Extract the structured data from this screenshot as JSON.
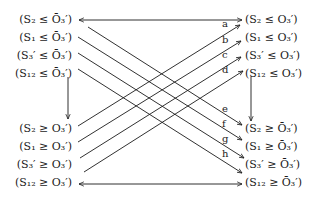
{
  "diagram": {
    "left_top": [
      "(S₂ ≤ Ō₃′)",
      "(S₁ ≤ Ō₃′)",
      "(S₃′ ≤ Ō₃′)",
      "(S₁₂ ≤ Ō₃′)"
    ],
    "left_bottom": [
      "(S₂ ≥ O₃′)",
      "(S₁ ≥ O₃′)",
      "(S₃′ ≥ O₃′)",
      "(S₁₂ ≥ O₃′)"
    ],
    "right_top": [
      "(S₂ ≤ O₃′)",
      "(S₁ ≤ O₃′)",
      "(S₃′ ≤ O₃′)",
      "(S₁₂ ≤ O₃′)"
    ],
    "right_bottom": [
      "(S₂ ≥ Ō₃′)",
      "(S₁ ≥ Ō₃′)",
      "(S₃′ ≥ Ō₃′)",
      "(S₁₂ ≥ Ō₃′)"
    ],
    "edge_labels": [
      "a",
      "b",
      "c",
      "d",
      "e",
      "f",
      "g",
      "h"
    ],
    "line_color": "#1a1a1a"
  }
}
